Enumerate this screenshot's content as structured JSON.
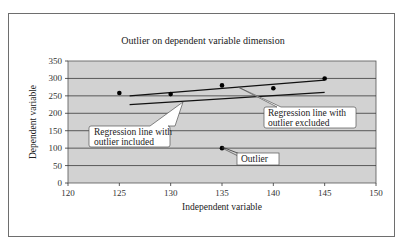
{
  "chart_data": {
    "type": "scatter",
    "title": "Outlier on dependent variable dimension",
    "xlabel": "Independent variable",
    "ylabel": "Dependent variable",
    "xlim": [
      120,
      150
    ],
    "ylim": [
      0,
      350
    ],
    "x_ticks": [
      120,
      125,
      130,
      135,
      140,
      145,
      150
    ],
    "y_ticks": [
      0,
      50,
      100,
      150,
      200,
      250,
      300,
      350
    ],
    "grid": {
      "horizontal": true,
      "vertical": false
    },
    "plot_background": "#d4d4d4",
    "series": [
      {
        "name": "Observations",
        "type": "scatter",
        "points": [
          {
            "x": 125,
            "y": 258
          },
          {
            "x": 130,
            "y": 255
          },
          {
            "x": 135,
            "y": 280
          },
          {
            "x": 140,
            "y": 272
          },
          {
            "x": 145,
            "y": 300
          },
          {
            "x": 135,
            "y": 100
          }
        ]
      },
      {
        "name": "Regression line with outlier excluded",
        "type": "line",
        "points": [
          {
            "x": 126,
            "y": 250
          },
          {
            "x": 145,
            "y": 295
          }
        ]
      },
      {
        "name": "Regression line with outlier included",
        "type": "line",
        "points": [
          {
            "x": 126,
            "y": 225
          },
          {
            "x": 145,
            "y": 260
          }
        ]
      }
    ],
    "annotations": [
      {
        "text": "Regression line with outlier included",
        "target": "included-line"
      },
      {
        "text": "Regression line with outlier excluded",
        "target": "excluded-line"
      },
      {
        "text": "Outlier",
        "target": {
          "x": 135,
          "y": 100
        }
      }
    ]
  },
  "labels": {
    "title": "Outlier on dependent variable dimension",
    "xlabel": "Independent variable",
    "ylabel": "Dependent variable",
    "x_ticks": [
      "120",
      "125",
      "130",
      "135",
      "140",
      "145",
      "150"
    ],
    "y_ticks": [
      "0",
      "50",
      "100",
      "150",
      "200",
      "250",
      "300",
      "350"
    ],
    "callout_included_1": "Regression line with",
    "callout_included_2": "outlier included",
    "callout_excluded_1": "Regression line with",
    "callout_excluded_2": "outlier excluded",
    "callout_outlier": "Outlier"
  }
}
